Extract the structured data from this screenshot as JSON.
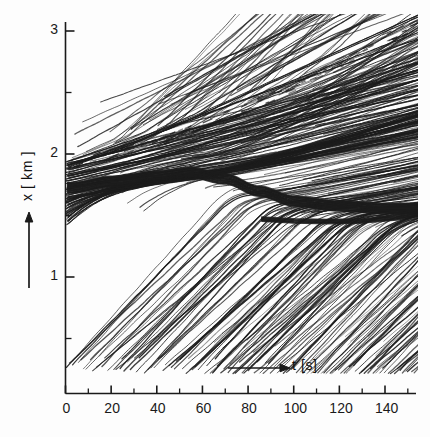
{
  "figure": {
    "kind": "traffic-trajectory-time-space-diagram",
    "background_color": "#fdfdfd",
    "ink_color": "#1c1c1c"
  },
  "axes": {
    "x_label": "t [s]",
    "y_label": "x [ km ]",
    "x_arrow": "horizontal-right-arrow",
    "y_arrow": "vertical-up-arrow",
    "x_ticks_major": [
      "0",
      "20",
      "40",
      "60",
      "80",
      "100",
      "120",
      "140"
    ],
    "x_ticks_major_values": [
      0,
      20,
      40,
      60,
      80,
      100,
      120,
      140
    ],
    "x_ticks_minor_values": [
      10,
      30,
      50,
      70,
      90,
      110,
      130,
      150
    ],
    "y_ticks_major": [
      "1",
      "2",
      "3"
    ],
    "y_ticks_major_values": [
      1,
      2,
      3
    ],
    "y_ticks_minor_values": [
      0.5,
      1.5,
      2.5
    ],
    "x_range": [
      0,
      158
    ],
    "y_range": [
      0.22,
      3.08
    ]
  },
  "chart_data": {
    "type": "line",
    "title": "",
    "xlabel": "t [s]",
    "ylabel": "x [ km ]",
    "xlim": [
      0,
      158
    ],
    "ylim": [
      0.22,
      3.08
    ],
    "grid": false,
    "legend": "none",
    "annotations": [],
    "series": [
      {
        "name": "jam-front-dark-band",
        "x": [
          2,
          20,
          40,
          55,
          70,
          85,
          100,
          120,
          140,
          157
        ],
        "values": [
          1.73,
          1.78,
          1.82,
          1.85,
          1.8,
          1.7,
          1.62,
          1.58,
          1.56,
          1.56
        ]
      },
      {
        "name": "congested-upper-envelope",
        "x": [
          2,
          20,
          40,
          60,
          80,
          100,
          120,
          140,
          157
        ],
        "values": [
          1.9,
          1.99,
          2.08,
          2.22,
          2.38,
          2.55,
          2.74,
          2.95,
          3.06
        ]
      },
      {
        "name": "congested-lower-envelope",
        "x": [
          2,
          20,
          40,
          60,
          80,
          100,
          120,
          140,
          157
        ],
        "values": [
          1.46,
          1.48,
          1.5,
          1.53,
          1.52,
          1.49,
          1.45,
          1.42,
          1.44
        ]
      },
      {
        "name": "free-flow-leading-edge",
        "x": [
          2,
          20,
          40,
          60,
          80,
          100,
          120,
          140,
          157
        ],
        "values": [
          1.42,
          1.45,
          1.46,
          1.44,
          1.42,
          1.4,
          1.38,
          1.38,
          1.4
        ]
      },
      {
        "name": "free-flow-trailing-edge",
        "x": [
          18,
          40,
          60,
          80,
          100,
          120,
          140,
          157
        ],
        "values": [
          0.24,
          0.26,
          0.3,
          0.36,
          0.44,
          0.56,
          0.72,
          0.88
        ]
      }
    ]
  }
}
